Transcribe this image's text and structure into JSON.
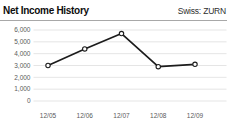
{
  "header": {
    "title": "Net Income History",
    "ticker": "Swiss: ZURN"
  },
  "chart_data": {
    "type": "line",
    "title": "Net Income History",
    "subtitle": "Swiss: ZURN",
    "categories": [
      "12/05",
      "12/06",
      "12/07",
      "12/08",
      "12/09"
    ],
    "series": [
      {
        "name": "Net Income",
        "values": [
          3000,
          4400,
          5700,
          2900,
          3100
        ]
      }
    ],
    "xlabel": "",
    "ylabel": "",
    "ylim": [
      0,
      6000
    ],
    "ytick_step": 1000,
    "ytick_labels": [
      "0",
      "1,000",
      "2,000",
      "3,000",
      "4,000",
      "5,000",
      "6,000"
    ],
    "grid": true,
    "legend": "none",
    "marker": "open-circle",
    "colors": {
      "line": "#1c1c1c",
      "marker_fill": "#ffffff",
      "marker_stroke": "#1c1c1c",
      "grid": "#dedede",
      "axis_text": "#5a5a5a",
      "title_text": "#0d0d0d",
      "ticker_text": "#2e2e2e",
      "divider": "#a8a8a8",
      "background": "#ffffff"
    }
  }
}
